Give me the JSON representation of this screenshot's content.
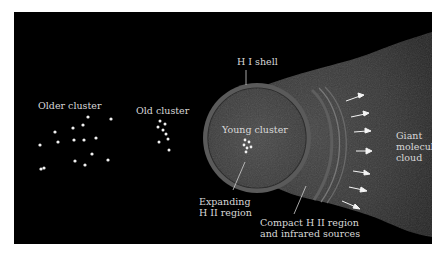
{
  "figure": {
    "background": "#000000",
    "labels": {
      "older_cluster": "Older cluster",
      "old_cluster": "Old cluster",
      "hi_shell": "H I shell",
      "young_cluster": "Young cluster",
      "expanding_hii_line1": "Expanding",
      "expanding_hii_line2": "H II region",
      "compact_hii_line1": "Compact H II region",
      "compact_hii_line2": "and infrared sources",
      "gmc_line1": "Giant",
      "gmc_line2": "molecular",
      "gmc_line3": "cloud"
    },
    "colors": {
      "star": "#f0f0f0",
      "cloud": "#3a3a3a",
      "hii_region": "#444444",
      "shell": "#6a6a6a",
      "label": "#d8d8d8",
      "arrow": "#f4f4f4"
    },
    "clusters": {
      "older_star_count": 16,
      "old_star_count": 8,
      "young_star_count": 6
    },
    "arrow_count": 7
  }
}
